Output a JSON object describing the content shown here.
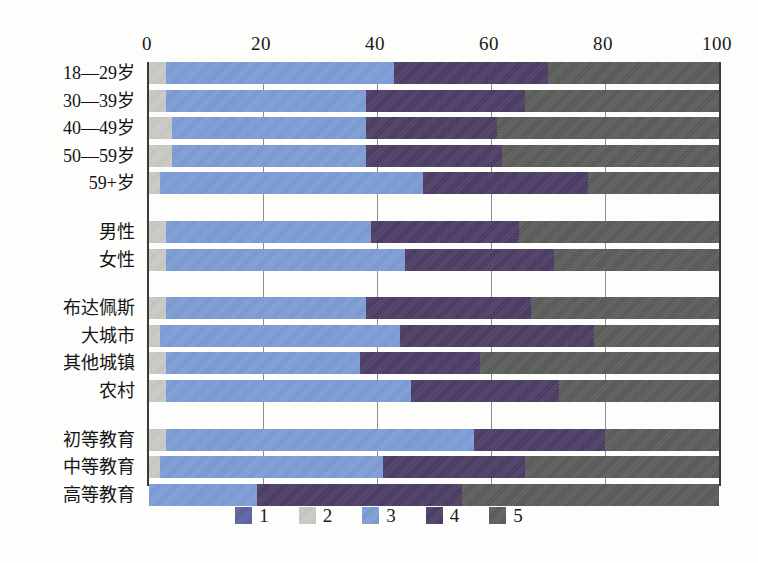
{
  "chart_data": {
    "type": "bar",
    "orientation": "horizontal",
    "stacked": true,
    "stack_mode": "percent",
    "title": "",
    "xlabel": "",
    "ylabel": "",
    "xlim": [
      0,
      100
    ],
    "xticks": [
      0,
      20,
      40,
      60,
      80,
      100
    ],
    "grid": true,
    "legend_position": "bottom",
    "legend": [
      "1",
      "2",
      "3",
      "4",
      "5"
    ],
    "series_colors": [
      "#5b5f9e",
      "#c9c9c5",
      "#7b9cd6",
      "#4a3a63",
      "#5a5a58"
    ],
    "categories": [
      "18—29岁",
      "30—39岁",
      "40—49岁",
      "50—59岁",
      "59+岁",
      "男性",
      "女性",
      "布达佩斯",
      "大城市",
      "其他城镇",
      "农村",
      "初等教育",
      "中等教育",
      "高等教育"
    ],
    "category_groups": [
      {
        "name": "age",
        "categories": [
          "18—29岁",
          "30—39岁",
          "40—49岁",
          "50—59岁",
          "59+岁"
        ]
      },
      {
        "name": "gender",
        "categories": [
          "男性",
          "女性"
        ]
      },
      {
        "name": "settlement",
        "categories": [
          "布达佩斯",
          "大城市",
          "其他城镇",
          "农村"
        ]
      },
      {
        "name": "education",
        "categories": [
          "初等教育",
          "中等教育",
          "高等教育"
        ]
      }
    ],
    "series": [
      {
        "name": "1",
        "values": [
          0,
          0,
          0,
          0,
          0,
          0,
          0,
          0,
          0,
          0,
          0,
          0,
          0,
          0
        ]
      },
      {
        "name": "2",
        "values": [
          3,
          3,
          4,
          4,
          2,
          3,
          3,
          3,
          2,
          3,
          3,
          3,
          2,
          0
        ]
      },
      {
        "name": "3",
        "values": [
          40,
          35,
          34,
          34,
          46,
          36,
          42,
          35,
          42,
          34,
          43,
          54,
          39,
          19
        ]
      },
      {
        "name": "4",
        "values": [
          27,
          28,
          23,
          24,
          29,
          26,
          26,
          29,
          34,
          21,
          26,
          23,
          25,
          36
        ]
      },
      {
        "name": "5",
        "values": [
          30,
          34,
          39,
          38,
          23,
          35,
          29,
          33,
          22,
          42,
          28,
          20,
          34,
          45
        ]
      }
    ],
    "rows": [
      {
        "label": "18—29岁",
        "values": [
          0,
          3,
          40,
          27,
          30
        ]
      },
      {
        "label": "30—39岁",
        "values": [
          0,
          3,
          35,
          28,
          34
        ]
      },
      {
        "label": "40—49岁",
        "values": [
          0,
          4,
          34,
          23,
          39
        ]
      },
      {
        "label": "50—59岁",
        "values": [
          0,
          4,
          34,
          24,
          38
        ]
      },
      {
        "label": "59+岁",
        "values": [
          0,
          2,
          46,
          29,
          23
        ]
      },
      {
        "label": "男性",
        "values": [
          0,
          3,
          36,
          26,
          35
        ]
      },
      {
        "label": "女性",
        "values": [
          0,
          3,
          42,
          26,
          29
        ]
      },
      {
        "label": "布达佩斯",
        "values": [
          0,
          3,
          35,
          29,
          33
        ]
      },
      {
        "label": "大城市",
        "values": [
          0,
          2,
          42,
          34,
          22
        ]
      },
      {
        "label": "其他城镇",
        "values": [
          0,
          3,
          34,
          21,
          42
        ]
      },
      {
        "label": "农村",
        "values": [
          0,
          3,
          43,
          26,
          28
        ]
      },
      {
        "label": "初等教育",
        "values": [
          0,
          3,
          54,
          23,
          20
        ]
      },
      {
        "label": "中等教育",
        "values": [
          0,
          2,
          39,
          25,
          34
        ]
      },
      {
        "label": "高等教育",
        "values": [
          0,
          0,
          19,
          36,
          45
        ]
      }
    ]
  }
}
